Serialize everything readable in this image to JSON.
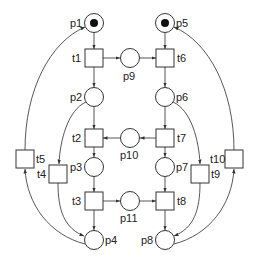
{
  "diagram": {
    "type": "petri-net",
    "places": [
      {
        "id": "p1",
        "label": "p1",
        "x": 94,
        "y": 23,
        "tokens": 1,
        "label_pos": "left"
      },
      {
        "id": "p2",
        "label": "p2",
        "x": 94,
        "y": 97,
        "tokens": 0,
        "label_pos": "left"
      },
      {
        "id": "p3",
        "label": "p3",
        "x": 94,
        "y": 167,
        "tokens": 0,
        "label_pos": "left"
      },
      {
        "id": "p4",
        "label": "p4",
        "x": 94,
        "y": 240,
        "tokens": 0,
        "label_pos": "right"
      },
      {
        "id": "p5",
        "label": "p5",
        "x": 165,
        "y": 23,
        "tokens": 1,
        "label_pos": "right"
      },
      {
        "id": "p6",
        "label": "p6",
        "x": 165,
        "y": 97,
        "tokens": 0,
        "label_pos": "right"
      },
      {
        "id": "p7",
        "label": "p7",
        "x": 165,
        "y": 167,
        "tokens": 0,
        "label_pos": "right"
      },
      {
        "id": "p8",
        "label": "p8",
        "x": 165,
        "y": 240,
        "tokens": 0,
        "label_pos": "left"
      },
      {
        "id": "p9",
        "label": "p9",
        "x": 130,
        "y": 59,
        "tokens": 0,
        "label_pos": "below"
      },
      {
        "id": "p10",
        "label": "p10",
        "x": 130,
        "y": 138,
        "tokens": 0,
        "label_pos": "below"
      },
      {
        "id": "p11",
        "label": "p11",
        "x": 130,
        "y": 201,
        "tokens": 0,
        "label_pos": "below"
      }
    ],
    "transitions": [
      {
        "id": "t1",
        "label": "t1",
        "x": 94,
        "y": 58,
        "label_pos": "left"
      },
      {
        "id": "t2",
        "label": "t2",
        "x": 94,
        "y": 138,
        "label_pos": "left"
      },
      {
        "id": "t3",
        "label": "t3",
        "x": 94,
        "y": 201,
        "label_pos": "left"
      },
      {
        "id": "t4",
        "label": "t4",
        "x": 58,
        "y": 174,
        "label_pos": "left"
      },
      {
        "id": "t5",
        "label": "t5",
        "x": 25,
        "y": 159,
        "label_pos": "right"
      },
      {
        "id": "t6",
        "label": "t6",
        "x": 165,
        "y": 58,
        "label_pos": "right"
      },
      {
        "id": "t7",
        "label": "t7",
        "x": 165,
        "y": 138,
        "label_pos": "right"
      },
      {
        "id": "t8",
        "label": "t8",
        "x": 165,
        "y": 201,
        "label_pos": "right"
      },
      {
        "id": "t9",
        "label": "t9",
        "x": 200,
        "y": 174,
        "label_pos": "right"
      },
      {
        "id": "t10",
        "label": "t10",
        "x": 235,
        "y": 159,
        "label_pos": "left"
      }
    ],
    "arcs": [
      {
        "from": "p1",
        "to": "t1"
      },
      {
        "from": "t1",
        "to": "p9"
      },
      {
        "from": "t1",
        "to": "p2"
      },
      {
        "from": "p9",
        "to": "t6"
      },
      {
        "from": "p5",
        "to": "t6"
      },
      {
        "from": "t6",
        "to": "p6"
      },
      {
        "from": "p2",
        "to": "t2"
      },
      {
        "from": "p2",
        "to": "t4"
      },
      {
        "from": "p6",
        "to": "t7"
      },
      {
        "from": "p6",
        "to": "t9"
      },
      {
        "from": "t7",
        "to": "p10"
      },
      {
        "from": "p10",
        "to": "t2"
      },
      {
        "from": "t2",
        "to": "p3"
      },
      {
        "from": "t7",
        "to": "p7"
      },
      {
        "from": "p3",
        "to": "t3"
      },
      {
        "from": "p7",
        "to": "t8"
      },
      {
        "from": "t3",
        "to": "p11"
      },
      {
        "from": "p11",
        "to": "t8"
      },
      {
        "from": "t3",
        "to": "p4"
      },
      {
        "from": "t8",
        "to": "p8"
      },
      {
        "from": "t4",
        "to": "p4"
      },
      {
        "from": "t9",
        "to": "p8"
      },
      {
        "from": "p4",
        "to": "t5"
      },
      {
        "from": "t5",
        "to": "p1"
      },
      {
        "from": "p8",
        "to": "t10"
      },
      {
        "from": "t10",
        "to": "p5"
      }
    ]
  },
  "labels": {
    "p1": "p1",
    "p2": "p2",
    "p3": "p3",
    "p4": "p4",
    "p5": "p5",
    "p6": "p6",
    "p7": "p7",
    "p8": "p8",
    "p9": "p9",
    "p10": "p10",
    "p11": "p11",
    "t1": "t1",
    "t2": "t2",
    "t3": "t3",
    "t4": "t4",
    "t5": "t5",
    "t6": "t6",
    "t7": "t7",
    "t8": "t8",
    "t9": "t9",
    "t10": "t10"
  }
}
